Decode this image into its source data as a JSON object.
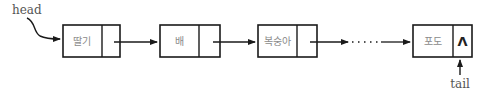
{
  "diagram": {
    "type": "singly-linked-list",
    "head_label": "head",
    "tail_label": "tail",
    "null_symbol": "Λ",
    "ellipsis": "· · · · ·",
    "nodes": [
      {
        "data": "딸기",
        "link": "next"
      },
      {
        "data": "배",
        "link": "next"
      },
      {
        "data": "복숭아",
        "link": "next"
      },
      {
        "data": "포도",
        "link": "null"
      }
    ],
    "colors": {
      "stroke": "#1a1a1a",
      "text": "#8a8a8a",
      "background": "#ffffff"
    }
  }
}
